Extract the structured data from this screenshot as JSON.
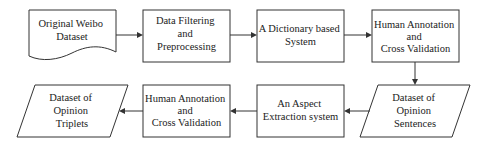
{
  "nodes": [
    {
      "id": "weibo",
      "shape": "document",
      "lines": [
        "Original Weibo",
        "Dataset"
      ]
    },
    {
      "id": "filter",
      "shape": "process",
      "lines": [
        "Data Filtering",
        "and",
        "Preprocessing"
      ]
    },
    {
      "id": "dict",
      "shape": "process",
      "lines": [
        "A Dictionary based",
        "System"
      ]
    },
    {
      "id": "human1",
      "shape": "process",
      "lines": [
        "Human Annotation",
        "and",
        "Cross Validation"
      ]
    },
    {
      "id": "sentences",
      "shape": "data",
      "lines": [
        "Dataset of",
        "Opinion",
        "Sentences"
      ]
    },
    {
      "id": "aspect",
      "shape": "process",
      "lines": [
        "An Aspect",
        "Extraction system"
      ]
    },
    {
      "id": "human2",
      "shape": "process",
      "lines": [
        "Human Annotation",
        "and",
        "Cross Validation"
      ]
    },
    {
      "id": "triplets",
      "shape": "data",
      "lines": [
        "Dataset of",
        "Opinion",
        "Triplets"
      ]
    }
  ],
  "edges": [
    {
      "from": "weibo",
      "to": "filter"
    },
    {
      "from": "filter",
      "to": "dict"
    },
    {
      "from": "dict",
      "to": "human1"
    },
    {
      "from": "human1",
      "to": "sentences"
    },
    {
      "from": "sentences",
      "to": "aspect"
    },
    {
      "from": "aspect",
      "to": "human2"
    },
    {
      "from": "human2",
      "to": "triplets"
    }
  ]
}
